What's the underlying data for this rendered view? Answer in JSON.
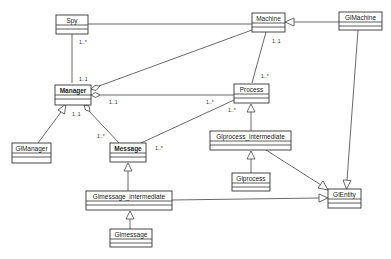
{
  "diagram": {
    "type": "uml-class-diagram",
    "classes": [
      {
        "id": "spy",
        "name": "Spy"
      },
      {
        "id": "machine",
        "name": "Machine"
      },
      {
        "id": "glmachine",
        "name": "GlMachine"
      },
      {
        "id": "manager",
        "name": "Manager"
      },
      {
        "id": "process",
        "name": "Process"
      },
      {
        "id": "glmanager",
        "name": "GlManager"
      },
      {
        "id": "message",
        "name": "Message"
      },
      {
        "id": "glprocess_intermediate",
        "name": "Glprocess_intermediate"
      },
      {
        "id": "glprocess",
        "name": "Glprocess"
      },
      {
        "id": "glentity",
        "name": "GlEntity"
      },
      {
        "id": "glmessage_intermediate",
        "name": "Glmessage_intermediate"
      },
      {
        "id": "glmessage",
        "name": "Glmessage"
      }
    ],
    "relations": [
      {
        "from": "spy",
        "to": "machine",
        "kind": "association"
      },
      {
        "from": "spy",
        "to": "manager",
        "kind": "association",
        "from_mult": "1..*",
        "to_mult": "1..1"
      },
      {
        "from": "machine",
        "to": "manager",
        "kind": "aggregation"
      },
      {
        "from": "process",
        "to": "manager",
        "kind": "aggregation",
        "from_mult": "1..*",
        "to_mult": "1..1"
      },
      {
        "from": "machine",
        "to": "process",
        "kind": "association",
        "from_mult": "1..1",
        "to_mult": "1..*"
      },
      {
        "from": "glmachine",
        "to": "machine",
        "kind": "generalization"
      },
      {
        "from": "glmachine",
        "to": "glentity",
        "kind": "generalization"
      },
      {
        "from": "glmanager",
        "to": "manager",
        "kind": "generalization"
      },
      {
        "from": "message",
        "to": "manager",
        "kind": "aggregation",
        "from_mult": "1..*",
        "to_mult": "1..1"
      },
      {
        "from": "message",
        "to": "process",
        "kind": "association",
        "from_mult": "1..*",
        "to_mult": "1..*"
      },
      {
        "from": "glprocess_intermediate",
        "to": "process",
        "kind": "generalization"
      },
      {
        "from": "glprocess_intermediate",
        "to": "glentity",
        "kind": "generalization"
      },
      {
        "from": "glprocess",
        "to": "glprocess_intermediate",
        "kind": "generalization"
      },
      {
        "from": "glmessage_intermediate",
        "to": "message",
        "kind": "generalization"
      },
      {
        "from": "glmessage_intermediate",
        "to": "glentity",
        "kind": "generalization"
      },
      {
        "from": "glmessage",
        "to": "glmessage_intermediate",
        "kind": "generalization"
      }
    ],
    "multiplicities": {
      "spy_manager_spy": "1..*",
      "spy_manager_manager": "1..1",
      "manager_process_manager": "1..1",
      "manager_process_process": "1..*",
      "machine_process_machine": "1..1",
      "machine_process_process": "1..*",
      "manager_message_manager": "1..1",
      "manager_message_message": "1..*",
      "message_process_message": "1..*",
      "message_process_process": "1..*"
    }
  }
}
